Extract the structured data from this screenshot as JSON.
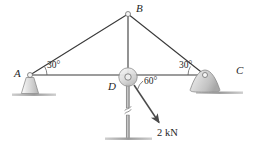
{
  "figure": {
    "type": "statics-truss-free-body-diagram",
    "background_color": "#ffffff",
    "line_color": "#3a3a3a",
    "support_fill": "#d9d9d9"
  },
  "joints": [
    {
      "id": "A",
      "label": "A",
      "x": 30,
      "y": 75,
      "label_x": 14,
      "label_y": 69,
      "support": "pin"
    },
    {
      "id": "B",
      "label": "B",
      "x": 128,
      "y": 14,
      "label_x": 136,
      "label_y": 4,
      "support": "none"
    },
    {
      "id": "C",
      "label": "C",
      "x": 205,
      "y": 75,
      "label_x": 236,
      "label_y": 66,
      "support": "rocker"
    },
    {
      "id": "D",
      "label": "D",
      "x": 128,
      "y": 77,
      "label_x": 109,
      "label_y": 82,
      "support": "none"
    }
  ],
  "members": [
    {
      "name": "member-AB",
      "from": "A",
      "to": "B"
    },
    {
      "name": "member-BC",
      "from": "B",
      "to": "C"
    },
    {
      "name": "member-AC",
      "from": "A",
      "to": "C"
    },
    {
      "name": "member-BD",
      "from": "B",
      "to": "D"
    },
    {
      "name": "member-D-ground",
      "from": "D",
      "to": "ground"
    }
  ],
  "angles": [
    {
      "name": "angle-at-A",
      "value": "30°",
      "x": 50,
      "y": 64,
      "vertex": "A"
    },
    {
      "name": "angle-at-C",
      "value": "30°",
      "x": 182,
      "y": 64,
      "vertex": "C"
    },
    {
      "name": "angle-at-D",
      "value": "60°",
      "x": 146,
      "y": 78,
      "vertex": "D"
    }
  ],
  "load": {
    "name": "applied-force",
    "label": "2 kN",
    "magnitude": 2,
    "unit": "kN",
    "label_x": 163,
    "label_y": 135,
    "arrow_start": {
      "x": 134,
      "y": 85
    },
    "arrow_end": {
      "x": 160,
      "y": 124
    },
    "direction_deg_from_horizontal": 60
  },
  "supports": {
    "a_support": {
      "name": "pin-support-A",
      "type": "fixed-trapezoid-pedestal"
    },
    "c_support": {
      "name": "rocker-support-C",
      "type": "rocker-dome"
    },
    "d_base": {
      "name": "ground-base-D",
      "type": "ground-line"
    }
  },
  "break_symbol": {
    "name": "member-break-symbol",
    "x": 128,
    "y": 110
  }
}
